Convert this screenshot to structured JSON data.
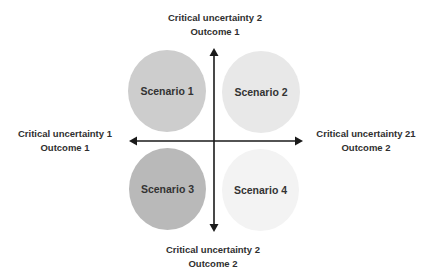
{
  "diagram": {
    "type": "scenario-matrix",
    "axis_labels": {
      "top": {
        "line1": "Critical uncertainty 2",
        "line2": "Outcome 1"
      },
      "bottom": {
        "line1": "Critical uncertainty 2",
        "line2": "Outcome 2"
      },
      "left": {
        "line1": "Critical uncertainty 1",
        "line2": "Outcome 1"
      },
      "right": {
        "line1": "Critical uncertainty 21",
        "line2": "Outcome 2"
      }
    },
    "scenarios": [
      {
        "label": "Scenario 1",
        "quadrant": "top-left",
        "color": "#cdcdcd"
      },
      {
        "label": "Scenario 2",
        "quadrant": "top-right",
        "color": "#e8e8e8"
      },
      {
        "label": "Scenario 3",
        "quadrant": "bottom-left",
        "color": "#b9b9b9"
      },
      {
        "label": "Scenario 4",
        "quadrant": "bottom-right",
        "color": "#f3f3f3"
      }
    ],
    "axis_color": "#1a1a1a"
  }
}
